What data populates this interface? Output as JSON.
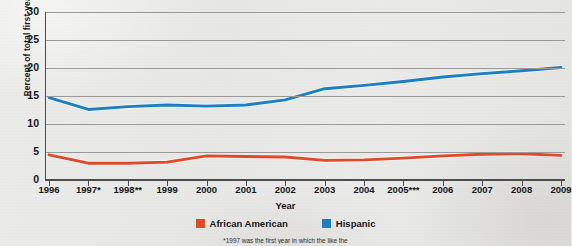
{
  "chart_data": {
    "type": "line",
    "title": "",
    "xlabel": "Year",
    "ylabel": "Percent of total first-year enrollment",
    "ylim": [
      0,
      30
    ],
    "ytick_labels": [
      "30",
      "25",
      "20",
      "15",
      "10",
      "5",
      "0"
    ],
    "ytick_values": [
      30,
      25,
      20,
      15,
      10,
      5,
      0
    ],
    "grid": "horizontal",
    "legend_position": "bottom-center",
    "categories": [
      "1996",
      "1997*",
      "1998**",
      "1999",
      "2000",
      "2001",
      "2002",
      "2003",
      "2004",
      "2005***",
      "2006",
      "2007",
      "2008",
      "2009"
    ],
    "x": [
      1996,
      1997,
      1998,
      1999,
      2000,
      2001,
      2002,
      2003,
      2004,
      2005,
      2006,
      2007,
      2008,
      2009
    ],
    "series": [
      {
        "name": "African American",
        "color": "#e04a28",
        "values": [
          4.5,
          3.0,
          3.0,
          3.2,
          4.3,
          4.2,
          4.1,
          3.5,
          3.6,
          3.9,
          4.3,
          4.6,
          4.7,
          4.4
        ]
      },
      {
        "name": "Hispanic",
        "color": "#1b7fc4",
        "values": [
          14.7,
          12.6,
          13.1,
          13.4,
          13.2,
          13.4,
          14.3,
          16.3,
          16.9,
          17.6,
          18.4,
          19.0,
          19.5,
          20.1
        ]
      }
    ],
    "footnote": "*1997 was the first year in which the like the"
  },
  "legend": [
    {
      "label": "African American",
      "color": "#e04a28",
      "icon": "square-swatch"
    },
    {
      "label": "Hispanic",
      "color": "#1b7fc4",
      "icon": "square-swatch"
    }
  ],
  "colors": {
    "african_american": "#e04a28",
    "hispanic": "#1b7fc4",
    "gridline": "#9a9a98",
    "axis": "#4a4c4e",
    "background": "#e9e9e7",
    "text": "#16181a"
  }
}
